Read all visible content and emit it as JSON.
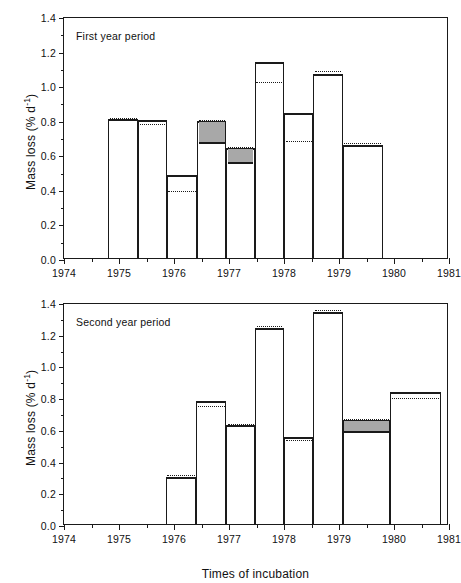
{
  "figure": {
    "xlabel": "Times of incubation",
    "ylabel_text": "Mass loss (% d",
    "ylabel_sup": "-1",
    "ylabel_tail": ")"
  },
  "chart_data": [
    {
      "type": "bar",
      "title": "First year period",
      "xlabel": "",
      "ylabel": "Mass loss (% d -1)",
      "xlim": [
        1974,
        1981
      ],
      "ylim": [
        0.0,
        1.4
      ],
      "yticks": [
        "0.0",
        "0.2",
        "0.4",
        "0.6",
        "0.8",
        "1.0",
        "1.2",
        "1.4"
      ],
      "ytick_values": [
        0.0,
        0.2,
        0.4,
        0.6,
        0.8,
        1.0,
        1.2,
        1.4
      ],
      "xticks": [
        "1974",
        "1975",
        "1976",
        "1977",
        "1978",
        "1979",
        "1980",
        "1981"
      ],
      "xtick_values": [
        1974,
        1975,
        1976,
        1977,
        1978,
        1979,
        1980,
        1981
      ],
      "grid": false,
      "legend": "none",
      "bars": [
        {
          "x_start": 1974.8,
          "x_end": 1975.35,
          "value": 0.815,
          "dotted": 0.82,
          "shade_top": null,
          "shade_bottom": null
        },
        {
          "x_start": 1975.35,
          "x_end": 1975.87,
          "value": 0.81,
          "dotted": 0.787,
          "shade_top": null,
          "shade_bottom": null
        },
        {
          "x_start": 1975.87,
          "x_end": 1976.42,
          "value": 0.49,
          "dotted": 0.402,
          "shade_top": null,
          "shade_bottom": null
        },
        {
          "x_start": 1976.42,
          "x_end": 1976.95,
          "value": 0.805,
          "dotted": 0.808,
          "shade_top": 0.805,
          "shade_bottom": 0.67
        },
        {
          "x_start": 1976.95,
          "x_end": 1977.47,
          "value": 0.65,
          "dotted": 0.653,
          "shade_top": 0.65,
          "shade_bottom": 0.557
        },
        {
          "x_start": 1977.47,
          "x_end": 1978.0,
          "value": 1.147,
          "dotted": 1.03,
          "shade_top": null,
          "shade_bottom": null
        },
        {
          "x_start": 1978.0,
          "x_end": 1978.53,
          "value": 0.85,
          "dotted": 0.69,
          "shade_top": null,
          "shade_bottom": null
        },
        {
          "x_start": 1978.53,
          "x_end": 1979.07,
          "value": 1.075,
          "dotted": 1.095,
          "shade_top": null,
          "shade_bottom": null
        },
        {
          "x_start": 1979.07,
          "x_end": 1979.8,
          "value": 0.668,
          "dotted": 0.678,
          "shade_top": null,
          "shade_bottom": null
        }
      ]
    },
    {
      "type": "bar",
      "title": "Second year period",
      "xlabel": "Times of incubation",
      "ylabel": "Mass loss (% d -1)",
      "xlim": [
        1974,
        1981
      ],
      "ylim": [
        0.0,
        1.4
      ],
      "yticks": [
        "0.0",
        "0.2",
        "0.4",
        "0.6",
        "0.8",
        "1.0",
        "1.2",
        "1.4"
      ],
      "ytick_values": [
        0.0,
        0.2,
        0.4,
        0.6,
        0.8,
        1.0,
        1.2,
        1.4
      ],
      "xticks": [
        "1974",
        "1975",
        "1976",
        "1977",
        "1978",
        "1979",
        "1980",
        "1981"
      ],
      "xtick_values": [
        1974,
        1975,
        1976,
        1977,
        1978,
        1979,
        1980,
        1981
      ],
      "grid": false,
      "legend": "none",
      "bars": [
        {
          "x_start": 1975.85,
          "x_end": 1976.4,
          "value": 0.312,
          "dotted": 0.322,
          "shade_top": null,
          "shade_bottom": null
        },
        {
          "x_start": 1976.4,
          "x_end": 1976.95,
          "value": 0.788,
          "dotted": 0.757,
          "shade_top": null,
          "shade_bottom": null
        },
        {
          "x_start": 1976.95,
          "x_end": 1977.48,
          "value": 0.635,
          "dotted": 0.645,
          "shade_top": null,
          "shade_bottom": null
        },
        {
          "x_start": 1977.48,
          "x_end": 1978.0,
          "value": 1.25,
          "dotted": 1.262,
          "shade_top": null,
          "shade_bottom": null
        },
        {
          "x_start": 1978.0,
          "x_end": 1978.53,
          "value": 0.563,
          "dotted": 0.545,
          "shade_top": null,
          "shade_bottom": null
        },
        {
          "x_start": 1978.53,
          "x_end": 1979.07,
          "value": 1.352,
          "dotted": 1.363,
          "shade_top": null,
          "shade_bottom": null
        },
        {
          "x_start": 1979.07,
          "x_end": 1979.93,
          "value": 0.67,
          "dotted": 0.675,
          "shade_top": 0.67,
          "shade_bottom": 0.585
        },
        {
          "x_start": 1979.93,
          "x_end": 1980.85,
          "value": 0.843,
          "dotted": 0.805,
          "shade_top": null,
          "shade_bottom": null
        }
      ]
    }
  ]
}
